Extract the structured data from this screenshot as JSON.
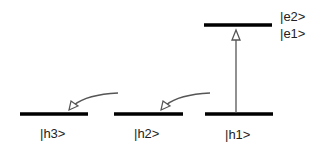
{
  "diagram": {
    "levels": {
      "e": {
        "labels": [
          "|e2>",
          "|e1>"
        ]
      },
      "h1": {
        "label": "|h1>"
      },
      "h2": {
        "label": "|h2>"
      },
      "h3": {
        "label": "|h3>"
      }
    },
    "arrows": [
      {
        "from": "h1",
        "to": "e1",
        "type": "excitation"
      },
      {
        "from": "h1",
        "to": "h2",
        "type": "relaxation"
      },
      {
        "from": "h2",
        "to": "h3",
        "type": "relaxation"
      }
    ],
    "colors": {
      "level_line": "#000000",
      "arrow": "#555555"
    }
  }
}
